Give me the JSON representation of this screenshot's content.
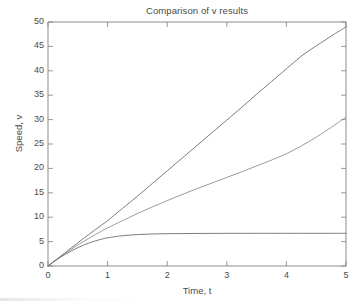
{
  "figure": {
    "background_color": "#ffffff",
    "axes_color": "#808080",
    "text_color": "#4a4a4a"
  },
  "chart_data": {
    "type": "line",
    "title": "Comparison of v results",
    "xlabel": "Time, t",
    "ylabel": "Speed, v",
    "xlim": [
      0,
      5
    ],
    "ylim": [
      0,
      50
    ],
    "xticks": [
      0,
      1,
      2,
      3,
      4,
      5
    ],
    "yticks": [
      0,
      5,
      10,
      15,
      20,
      25,
      30,
      35,
      40,
      45,
      50
    ],
    "xtick_labels": [
      "0",
      "1",
      "2",
      "3",
      "4",
      "5"
    ],
    "ytick_labels": [
      "0",
      "5",
      "10",
      "15",
      "20",
      "25",
      "30",
      "35",
      "40",
      "45",
      "50"
    ],
    "grid": false,
    "legend": null,
    "tick_direction": "in",
    "x": [
      0,
      0.1,
      0.2,
      0.3,
      0.4,
      0.5,
      0.6,
      0.7,
      0.8,
      0.9,
      1.0,
      1.25,
      1.5,
      1.75,
      2.0,
      2.25,
      2.5,
      2.75,
      3.0,
      3.25,
      3.5,
      3.75,
      4.0,
      4.25,
      4.5,
      4.75,
      5.0
    ],
    "series": [
      {
        "name": "curve-upper",
        "color": "#6e6e6e",
        "values": [
          0,
          0.95,
          1.9,
          2.85,
          3.8,
          4.75,
          5.7,
          6.6,
          7.5,
          8.4,
          9.3,
          11.8,
          14.3,
          16.9,
          19.5,
          22.1,
          24.7,
          27.3,
          29.9,
          32.5,
          35.2,
          37.8,
          40.4,
          43.0,
          45.1,
          47.1,
          49.0
        ]
      },
      {
        "name": "curve-middle",
        "color": "#8f8f8f",
        "values": [
          0,
          0.92,
          1.82,
          2.68,
          3.5,
          4.3,
          5.05,
          5.78,
          6.48,
          7.15,
          7.8,
          9.3,
          10.75,
          12.1,
          13.4,
          14.65,
          15.85,
          17.0,
          18.15,
          19.3,
          20.5,
          21.7,
          23.0,
          24.6,
          26.4,
          28.4,
          30.5
        ]
      },
      {
        "name": "curve-lower",
        "color": "#6e6e6e",
        "values": [
          0,
          0.9,
          1.72,
          2.47,
          3.14,
          3.75,
          4.3,
          4.77,
          5.18,
          5.5,
          5.78,
          6.2,
          6.44,
          6.56,
          6.62,
          6.65,
          6.67,
          6.68,
          6.69,
          6.7,
          6.7,
          6.7,
          6.7,
          6.7,
          6.7,
          6.7,
          6.7
        ]
      }
    ]
  }
}
